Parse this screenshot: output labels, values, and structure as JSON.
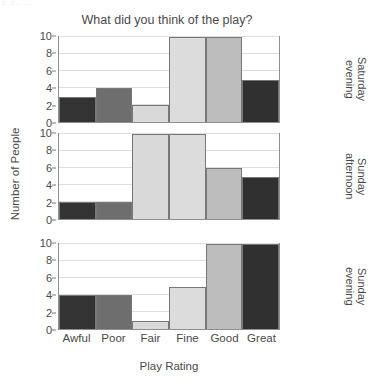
{
  "fragment_top": "c..c...  ...",
  "chart_data": {
    "type": "bar",
    "title": "What did you think of the play?",
    "xlabel": "Play Rating",
    "ylabel": "Number of People",
    "categories": [
      "Awful",
      "Poor",
      "Fair",
      "Fine",
      "Good",
      "Great"
    ],
    "ylim": [
      0,
      10
    ],
    "yticks": [
      0,
      2,
      4,
      6,
      8,
      10
    ],
    "grid": true,
    "legend": "none",
    "facet_position": "right",
    "category_colors": {
      "Awful": "#333333",
      "Poor": "#6e6e6e",
      "Fair": "#d9d9d9",
      "Fine": "#dcdcdc",
      "Good": "#bdbdbd",
      "Great": "#303030"
    },
    "panels": [
      {
        "label": "Saturday\nevening",
        "values": [
          3,
          4,
          2,
          10,
          10,
          5
        ]
      },
      {
        "label": "Sunday\nafternoon",
        "values": [
          2,
          2,
          10,
          10,
          6,
          5
        ]
      },
      {
        "label": "Sunday\nevening",
        "values": [
          4,
          4,
          1,
          5,
          10,
          10
        ]
      }
    ]
  }
}
